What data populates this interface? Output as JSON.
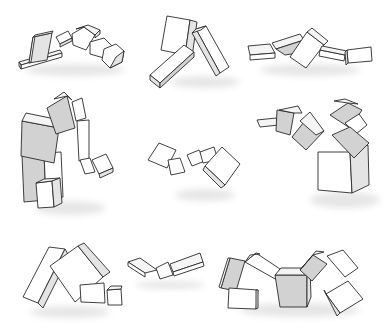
{
  "image": {
    "description": "Grid of nine 3D block-creature figures rendered as line drawings with light gray shading and soft ground shadows",
    "background": "#ffffff",
    "colors": {
      "outline": "#2a2a2a",
      "front_face": "#ffffff",
      "side_face": "#e4e4e4",
      "shaded_face": "#d2d2d2",
      "shadow": "#c8c8c8"
    },
    "grid": {
      "rows": 3,
      "cols": 3
    },
    "figures": [
      {
        "id": "fig-1",
        "row": 1,
        "col": 1,
        "desc": "low chain of flat slabs and cubes arching to the right"
      },
      {
        "id": "fig-2",
        "row": 1,
        "col": 2,
        "desc": "three large slabs leaning in an inverted V"
      },
      {
        "id": "fig-3",
        "row": 1,
        "col": 3,
        "desc": "horizontal chain of slabs and a tilted cube"
      },
      {
        "id": "fig-4",
        "row": 2,
        "col": 1,
        "desc": "tall stacked column bending over into a hanging arm"
      },
      {
        "id": "fig-5",
        "row": 2,
        "col": 2,
        "desc": "small floating chain of cubes"
      },
      {
        "id": "fig-6",
        "row": 2,
        "col": 3,
        "desc": "large base cube with a cluster of cubes and an arm"
      },
      {
        "id": "fig-7",
        "row": 3,
        "col": 1,
        "desc": "two large slabs forming a tent with small blocks at the base"
      },
      {
        "id": "fig-8",
        "row": 3,
        "col": 2,
        "desc": "short flat chain of three thin slabs"
      },
      {
        "id": "fig-9",
        "row": 3,
        "col": 3,
        "desc": "long arching walker of slabs around a central cube"
      }
    ]
  }
}
